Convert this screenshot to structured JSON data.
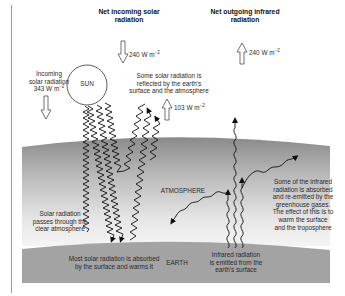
{
  "diagram": {
    "title_incoming": "Net incoming solar radiation",
    "title_outgoing": "Net outgoing infrared radiation",
    "labels": {
      "sun": "SUN",
      "atmosphere": "ATMOSPHERE",
      "earth": "EARTH"
    },
    "fluxes": {
      "net_incoming": "240 W m",
      "net_outgoing": "240 W m",
      "incoming_solar": "343 W m",
      "reflected": "103 W m",
      "unit_exponent": "−2"
    },
    "annotations": {
      "incoming_solar_line1": "Incoming",
      "incoming_solar_line2": "solar radiation",
      "reflected_line1": "Some solar radiation is",
      "reflected_line2": "reflected by the earth's",
      "reflected_line3": "surface and the atmosphere",
      "passes_line1": "Solar radiation",
      "passes_line2": "passes through the",
      "passes_line3": "clear atmosphere",
      "absorbed_line1": "Most solar radiation is absorbed",
      "absorbed_line2": "by the surface and warms it",
      "ir_emitted_line1": "Infrared radiation",
      "ir_emitted_line2": "is emitted from the",
      "ir_emitted_line3": "earth's surface",
      "greenhouse_line1": "Some of the infrared",
      "greenhouse_line2": "radiation is absorbed",
      "greenhouse_line3": "and re-emitted by the",
      "greenhouse_line4": "greenhouse gases.",
      "greenhouse_line5": "The effect of this is to",
      "greenhouse_line6": "warm the surface",
      "greenhouse_line7": "and the troposphere"
    },
    "colors": {
      "background": "#ffffff",
      "atmosphere_top": "#8c8c8c",
      "atmosphere_bottom": "#f2f2f2",
      "earth": "#a3a3a3",
      "text": "#2a2a2a"
    }
  }
}
